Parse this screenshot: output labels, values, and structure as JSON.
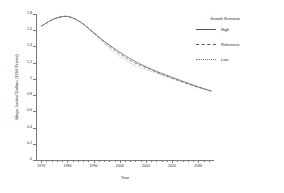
{
  "chart_data": {
    "type": "line",
    "title": "",
    "xlabel": "Year",
    "ylabel": "Mega Joules/ Dollars (1994 Prices)",
    "xlim": [
      1968,
      2036
    ],
    "ylim": [
      0,
      1.8
    ],
    "grid": false,
    "legend_position": "right",
    "legend_title": "Growth Scenario",
    "xticks": [
      1970,
      1980,
      1990,
      2000,
      2010,
      2020,
      2030
    ],
    "xtick_labels": [
      "1970",
      "1980",
      "1990",
      "2000",
      "2010",
      "2020",
      "2030"
    ],
    "yticks": [
      0,
      0.2,
      0.4,
      0.6,
      0.8,
      1,
      1.2,
      1.4,
      1.6,
      1.8
    ],
    "ytick_labels": [
      "0",
      "0.2",
      "0.4",
      "0.6",
      "0.8",
      "1",
      "1.2",
      "1.4",
      "1.6",
      "1.8"
    ],
    "x": [
      1970,
      1975,
      1980,
      1985,
      1990,
      1995,
      2000,
      2005,
      2010,
      2015,
      2020,
      2025,
      2030,
      2035
    ],
    "series": [
      {
        "name": "High",
        "style": "solid",
        "color": "#555555",
        "values": [
          1.65,
          1.74,
          1.77,
          1.7,
          1.57,
          1.44,
          1.33,
          1.23,
          1.15,
          1.08,
          1.02,
          0.96,
          0.9,
          0.85
        ]
      },
      {
        "name": "Reference",
        "style": "dashed",
        "color": "#555555",
        "values": [
          1.65,
          1.74,
          1.77,
          1.7,
          1.57,
          1.43,
          1.31,
          1.21,
          1.14,
          1.07,
          1.01,
          0.95,
          0.9,
          0.85
        ]
      },
      {
        "name": "Low",
        "style": "dotted",
        "color": "#777777",
        "values": [
          1.65,
          1.74,
          1.77,
          1.7,
          1.56,
          1.41,
          1.28,
          1.18,
          1.12,
          1.06,
          1.0,
          0.95,
          0.89,
          0.85
        ]
      }
    ]
  },
  "legend": {
    "title": "Growth Scenario",
    "items": [
      {
        "label": "High"
      },
      {
        "label": "Reference"
      },
      {
        "label": "Low"
      }
    ]
  },
  "axes": {
    "x_title": "Year",
    "y_title": "Mega Joules/ Dollars (1994 Prices)"
  }
}
